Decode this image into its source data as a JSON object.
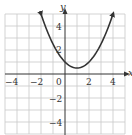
{
  "chart_data": {
    "type": "line",
    "title": "",
    "xlabel": "x",
    "ylabel": "y",
    "xlim": [
      -5,
      5
    ],
    "ylim": [
      -5,
      5
    ],
    "grid": true,
    "x_ticks": [
      -4,
      -2,
      0,
      2,
      4
    ],
    "y_ticks": [
      -4,
      -2,
      2,
      4
    ],
    "x_tick_labels": [
      "−4",
      "−2",
      "0",
      "2",
      "4"
    ],
    "y_tick_labels": [
      "−4",
      "−2",
      "2",
      "4"
    ],
    "series": [
      {
        "name": "parabola",
        "equation": "y = 0.5(x - 1)^2 + 0.5",
        "x": [
          -2,
          -1.5,
          -1,
          -0.5,
          0,
          0.5,
          1,
          1.5,
          2,
          2.5,
          3,
          3.5,
          4
        ],
        "y": [
          5,
          3.625,
          2.5,
          1.625,
          1,
          0.625,
          0.5,
          0.625,
          1,
          1.625,
          2.5,
          3.625,
          5
        ],
        "arrows_at_ends": true
      }
    ],
    "color": "#333333"
  },
  "labels": {
    "x_axis": "x",
    "y_axis": "y",
    "tick_x_m4": "−4",
    "tick_x_m2": "−2",
    "tick_x_0": "0",
    "tick_x_2": "2",
    "tick_x_4": "4",
    "tick_y_4": "4",
    "tick_y_2": "2",
    "tick_y_m2": "−2",
    "tick_y_m4": "−4"
  }
}
